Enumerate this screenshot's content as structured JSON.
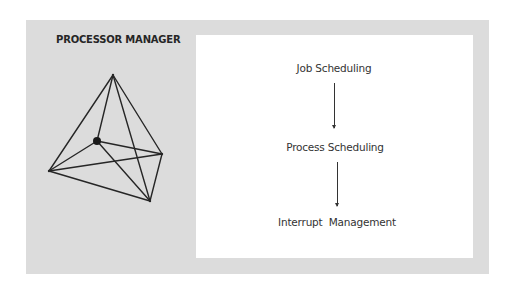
{
  "title": "PROCESSOR MANAGER",
  "colors": {
    "panel_background": "#dcdcdc",
    "content_background": "#ffffff",
    "line": "#262626",
    "text": "#333333"
  },
  "illustration": {
    "type": "wireframe-polyhedron",
    "vertices": {
      "top": [
        113,
        75
      ],
      "hub": [
        97,
        141
      ],
      "left": [
        49,
        171
      ],
      "right": [
        162,
        154
      ],
      "bottom": [
        150,
        201
      ]
    },
    "highlighted_vertex": "hub"
  },
  "flow": {
    "steps": [
      {
        "label": "Job Scheduling"
      },
      {
        "label": "Process Scheduling"
      },
      {
        "label": "Interrupt  Management"
      }
    ],
    "connector": "arrow-down"
  }
}
